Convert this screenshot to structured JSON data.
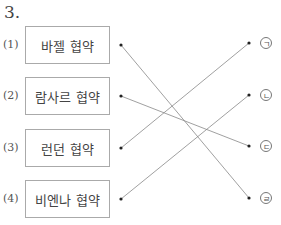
{
  "question": {
    "number": "3."
  },
  "items": [
    {
      "label": "(1)",
      "text": "바젤 협약",
      "y": 26
    },
    {
      "label": "(2)",
      "text": "람사르 협약",
      "y": 77
    },
    {
      "label": "(3)",
      "text": "런던 협약",
      "y": 129
    },
    {
      "label": "(4)",
      "text": "비엔나 협약",
      "y": 180
    }
  ],
  "answers": [
    {
      "symbol": "ㄱ",
      "y": 43
    },
    {
      "symbol": "ㄴ",
      "y": 95
    },
    {
      "symbol": "ㄷ",
      "y": 146
    },
    {
      "symbol": "ㄹ",
      "y": 198
    }
  ],
  "connections": [
    {
      "from": "(1)",
      "to": "ㄹ"
    },
    {
      "from": "(2)",
      "to": "ㄷ"
    },
    {
      "from": "(3)",
      "to": "ㄱ"
    },
    {
      "from": "(4)",
      "to": "ㄴ"
    }
  ]
}
